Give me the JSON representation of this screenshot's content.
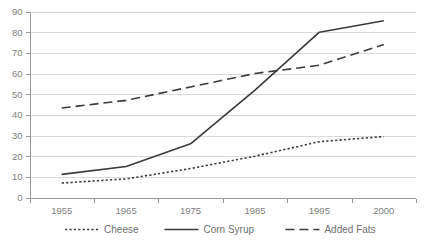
{
  "chart_data": {
    "type": "line",
    "title": "",
    "subtitle": "",
    "xlabel": "",
    "ylabel": "",
    "categories": [
      "1955",
      "1965",
      "1975",
      "1985",
      "1995",
      "2000"
    ],
    "x_tick_labels": [
      "1955",
      "1965",
      "1975",
      "1985",
      "1995",
      "2000"
    ],
    "y_tick_labels": [
      "0",
      "10",
      "20",
      "30",
      "40",
      "50",
      "60",
      "70",
      "80",
      "90"
    ],
    "y_ticks": [
      0,
      10,
      20,
      30,
      40,
      50,
      60,
      70,
      80,
      90
    ],
    "ylim": [
      0,
      90
    ],
    "grid": "horizontal",
    "legend_position": "bottom",
    "series": [
      {
        "name": "Cheese",
        "style": "dotted",
        "color": "#3a3a3a",
        "values": [
          7.0,
          9.0,
          14.0,
          20.0,
          27.0,
          29.5
        ]
      },
      {
        "name": "Corn Syrup",
        "style": "solid",
        "color": "#3a3a3a",
        "values": [
          11.2,
          15.0,
          26.0,
          52.0,
          80.0,
          85.5
        ]
      },
      {
        "name": "Added Fats",
        "style": "dashed",
        "color": "#3a3a3a",
        "values": [
          43.3,
          47.0,
          53.5,
          60.0,
          64.0,
          74.0
        ]
      }
    ],
    "legend": [
      {
        "label": "Cheese",
        "style": "dotted"
      },
      {
        "label": "Corn Syrup",
        "style": "solid"
      },
      {
        "label": "Added Fats",
        "style": "dashed"
      }
    ],
    "colors": {
      "line": "#3a3a3a",
      "grid": "#d9d9d9",
      "axis": "#9a9a9a",
      "tick_label": "#808080",
      "legend_label": "#6f6f6f",
      "background": "#ffffff"
    }
  }
}
